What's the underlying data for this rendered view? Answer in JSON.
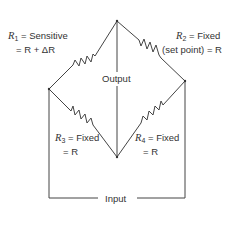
{
  "diagram": {
    "type": "wheatstone-bridge",
    "nodes": {
      "top": [
        117,
        21
      ],
      "left": [
        49,
        89
      ],
      "right": [
        185,
        81
      ],
      "bottom": [
        117,
        157
      ]
    },
    "resistors": [
      {
        "id": "R1",
        "symbol": "R",
        "sub": "1",
        "line1": "= Sensitive",
        "line2": "= R + ΔR",
        "from": "left",
        "to": "top"
      },
      {
        "id": "R2",
        "symbol": "R",
        "sub": "2",
        "line1": "= Fixed",
        "line2": "(set point) = R",
        "from": "top",
        "to": "right"
      },
      {
        "id": "R3",
        "symbol": "R",
        "sub": "3",
        "line1": "= Fixed",
        "line2": "= R",
        "from": "left",
        "to": "bottom"
      },
      {
        "id": "R4",
        "symbol": "R",
        "sub": "4",
        "line1": "= Fixed",
        "line2": "= R",
        "from": "right",
        "to": "bottom"
      }
    ],
    "output_label": "Output",
    "input_label": "Input",
    "line_color": "#444444"
  }
}
